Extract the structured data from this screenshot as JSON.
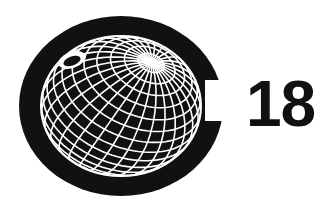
{
  "logo": {
    "number": "18",
    "colors": {
      "ink": "#111111",
      "background": "#ffffff",
      "grid": "#ffffff"
    },
    "emblem": "globe-in-c-icon"
  }
}
